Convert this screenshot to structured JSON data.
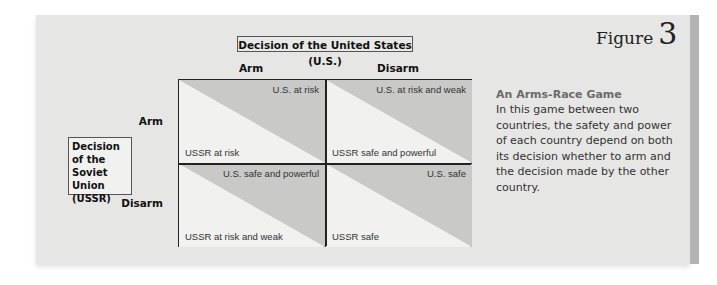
{
  "figure": {
    "word": "Figure",
    "number": "3"
  },
  "caption": {
    "title": "An Arms-Race Game",
    "body": "In this game between two countries, the safety and power of each country depend on both its decision whether to arm and the decision made by the other country."
  },
  "matrix": {
    "column_header": "Decision of the United States (U.S.)",
    "columns": [
      "Arm",
      "Disarm"
    ],
    "row_header": [
      "Decision",
      "of the",
      "Soviet Union",
      "(USSR)"
    ],
    "rows": [
      "Arm",
      "Disarm"
    ],
    "cells": [
      [
        {
          "us": "U.S. at risk",
          "ussr": "USSR at risk"
        },
        {
          "us": "U.S. at risk and weak",
          "ussr": "USSR safe and powerful"
        }
      ],
      [
        {
          "us": "U.S. safe and powerful",
          "ussr": "USSR at risk and weak"
        },
        {
          "us": "U.S. safe",
          "ussr": "USSR safe"
        }
      ]
    ]
  },
  "colors": {
    "panel": "#e6e6e5",
    "us_triangle": "#c9c9c8",
    "ussr_triangle": "#f1f1ef",
    "side_band": "#b3b3b3",
    "caption_title": "#6b6b6b"
  }
}
